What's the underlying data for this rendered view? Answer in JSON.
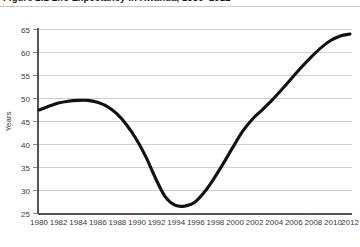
{
  "figure": {
    "title": "Figure 2.1 Life Expectancy in Rwanda, 1980–2012"
  },
  "chart_data": {
    "type": "line",
    "title": "Figure 2.1 Life Expectancy in Rwanda, 1980–2012",
    "xlabel": "",
    "ylabel": "Years",
    "xlim": [
      1980,
      2012
    ],
    "ylim": [
      25,
      65
    ],
    "yticks": [
      25,
      30,
      35,
      40,
      45,
      50,
      55,
      60,
      65
    ],
    "xticks": [
      1980,
      1982,
      1984,
      1986,
      1988,
      1990,
      1992,
      1994,
      1996,
      1998,
      2000,
      2002,
      2004,
      2006,
      2008,
      2010,
      2012
    ],
    "grid": "horizontal",
    "legend": "none",
    "series": [
      {
        "name": "Life expectancy",
        "color": "#111111",
        "x": [
          1980,
          1981,
          1982,
          1983,
          1984,
          1985,
          1986,
          1987,
          1988,
          1989,
          1990,
          1991,
          1992,
          1993,
          1994,
          1995,
          1996,
          1997,
          1998,
          1999,
          2000,
          2001,
          2002,
          2003,
          2004,
          2005,
          2006,
          2007,
          2008,
          2009,
          2010,
          2011,
          2012
        ],
        "values": [
          47.5,
          48.3,
          49.0,
          49.4,
          49.6,
          49.6,
          49.2,
          48.3,
          46.7,
          44.3,
          41.2,
          37.3,
          32.6,
          28.6,
          26.8,
          26.6,
          27.4,
          29.6,
          32.6,
          36.0,
          39.6,
          43.0,
          45.6,
          47.6,
          49.7,
          52.0,
          54.4,
          56.8,
          59.0,
          61.0,
          62.6,
          63.6,
          64.0
        ]
      }
    ],
    "annotations": []
  },
  "axis": {
    "y_label": "Years",
    "y_tick_labels": [
      "65",
      "60",
      "55",
      "50",
      "45",
      "40",
      "35",
      "30",
      "25"
    ],
    "x_tick_labels": [
      "1980",
      "1982",
      "1984",
      "1986",
      "1988",
      "1990",
      "1992",
      "1994",
      "1996",
      "1998",
      "2000",
      "2002",
      "2004",
      "2006",
      "2008",
      "2010",
      "2012"
    ]
  },
  "colors": {
    "line": "#111111",
    "grid": "#d0d0d0",
    "axis": "#555555",
    "plot_background": "#ffffff",
    "page_background": "#d9d9d9"
  }
}
